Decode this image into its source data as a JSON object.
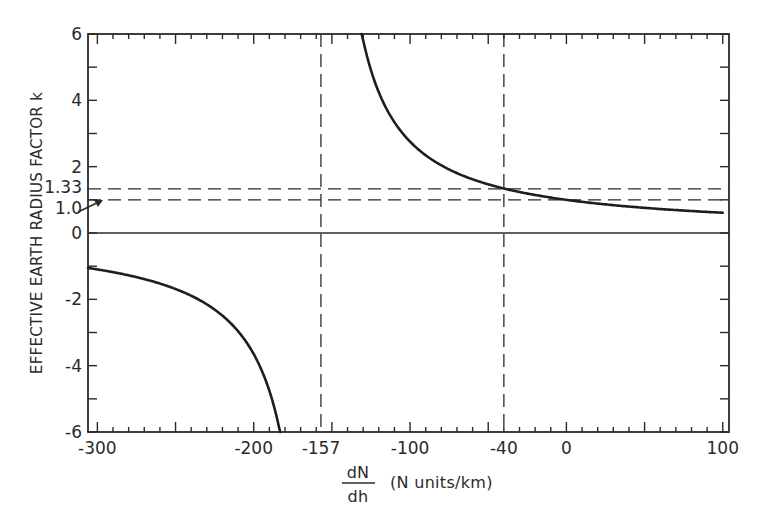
{
  "chart_data": {
    "type": "line",
    "title": "",
    "xlabel_fraction_numerator": "dN",
    "xlabel_fraction_denominator": "dh",
    "xlabel_units": "(N units/km)",
    "ylabel": "EFFECTIVE EARTH RADIUS FACTOR  k",
    "xlim": [
      -306,
      104
    ],
    "ylim": [
      -6,
      6
    ],
    "grid": false,
    "x_ticks": [
      {
        "value": -300,
        "label": "-300"
      },
      {
        "value": -200,
        "label": "-200"
      },
      {
        "value": -157,
        "label": "-157"
      },
      {
        "value": -100,
        "label": "-100"
      },
      {
        "value": -40,
        "label": "-40"
      },
      {
        "value": 0,
        "label": "0"
      },
      {
        "value": 100,
        "label": "100"
      }
    ],
    "y_ticks": [
      {
        "value": 6,
        "label": "6"
      },
      {
        "value": 4,
        "label": "4"
      },
      {
        "value": 2,
        "label": "2"
      },
      {
        "value": 1.33,
        "label": "1.33"
      },
      {
        "value": 1.0,
        "label": "1.0"
      },
      {
        "value": 0,
        "label": "0"
      },
      {
        "value": -2,
        "label": "-2"
      },
      {
        "value": -4,
        "label": "-4"
      },
      {
        "value": -6,
        "label": "-6"
      }
    ],
    "formula": "k = 1 / (1 + (dN/dh)/157)",
    "series": [
      {
        "name": "k vs dN/dh (branch dN/dh > -157)",
        "x": [
          -131,
          -125,
          -120,
          -110,
          -100,
          -90,
          -80,
          -70,
          -60,
          -50,
          -40,
          -30,
          -20,
          -10,
          0,
          20,
          40,
          60,
          80,
          100
        ],
        "y": [
          6.04,
          4.91,
          4.24,
          3.34,
          2.75,
          2.34,
          2.04,
          1.8,
          1.62,
          1.47,
          1.34,
          1.24,
          1.15,
          1.07,
          1.0,
          0.89,
          0.8,
          0.72,
          0.66,
          0.61
        ]
      },
      {
        "name": "k vs dN/dh (branch dN/dh < -157)",
        "x": [
          -306,
          -300,
          -280,
          -260,
          -240,
          -220,
          -210,
          -200,
          -195,
          -190,
          -183
        ],
        "y": [
          -1.05,
          -1.1,
          -1.28,
          -1.52,
          -1.89,
          -2.49,
          -2.96,
          -3.65,
          -4.13,
          -4.76,
          -6.04
        ]
      }
    ],
    "reference_lines": [
      {
        "orientation": "vertical",
        "value": -157,
        "style": "dashed"
      },
      {
        "orientation": "vertical",
        "value": -40,
        "style": "dashed"
      },
      {
        "orientation": "horizontal",
        "value": 1.33,
        "style": "dashed"
      },
      {
        "orientation": "horizontal",
        "value": 1.0,
        "style": "dashed"
      },
      {
        "orientation": "horizontal",
        "value": 0,
        "style": "solid"
      }
    ],
    "annotations": [
      {
        "text": "1.0",
        "points_to": {
          "x": -306,
          "y": 1.0
        },
        "style": "arrow"
      }
    ]
  }
}
